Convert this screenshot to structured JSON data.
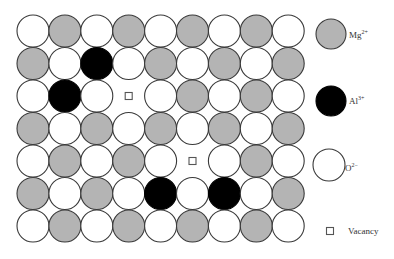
{
  "diagram": {
    "title": "",
    "grid": {
      "columns": 9,
      "rows": 7,
      "origin_x": 33,
      "origin_y": 31,
      "spacing_x": 31.9,
      "spacing_y": 32.5,
      "radius": 16,
      "cells": [
        [
          "O",
          "Mg",
          "O",
          "Mg",
          "O",
          "Mg",
          "O",
          "Mg",
          "O"
        ],
        [
          "Mg",
          "O",
          "Al",
          "O",
          "Mg",
          "O",
          "Mg",
          "O",
          "Mg"
        ],
        [
          "O",
          "Al",
          "O",
          "V",
          "O",
          "Mg",
          "O",
          "Mg",
          "O"
        ],
        [
          "Mg",
          "O",
          "Mg",
          "O",
          "Mg",
          "O",
          "Mg",
          "O",
          "Mg"
        ],
        [
          "O",
          "Mg",
          "O",
          "Mg",
          "O",
          "V",
          "O",
          "Mg",
          "O"
        ],
        [
          "Mg",
          "O",
          "Mg",
          "O",
          "Al",
          "O",
          "Al",
          "O",
          "Mg"
        ],
        [
          "O",
          "Mg",
          "O",
          "Mg",
          "O",
          "Mg",
          "O",
          "Mg",
          "O"
        ]
      ]
    },
    "species": {
      "Mg": {
        "symbol": "Mg",
        "charge": "2+",
        "fill": "#b4b4b4",
        "stroke": "#3a3a3a"
      },
      "Al": {
        "symbol": "Al",
        "charge": "3+",
        "fill": "#000000",
        "stroke": "#000000"
      },
      "O": {
        "symbol": "O",
        "charge": "2−",
        "fill": "#ffffff",
        "stroke": "#3a3a3a"
      },
      "V": {
        "symbol": "Vacancy",
        "charge": "",
        "fill": "#ffffff",
        "stroke": "#555555"
      }
    },
    "legend": {
      "items": [
        {
          "key": "Mg",
          "shape": "circle",
          "cx": 331,
          "cy": 34,
          "r": 15,
          "label_symbol": "Mg",
          "label_charge": "2+",
          "label_x": 349,
          "label_y": 30
        },
        {
          "key": "Al",
          "shape": "circle",
          "cx": 331,
          "cy": 101,
          "r": 15,
          "label_symbol": "Al",
          "label_charge": "3+",
          "label_x": 349,
          "label_y": 96
        },
        {
          "key": "O",
          "shape": "circle",
          "cx": 329,
          "cy": 165,
          "r": 16,
          "label_symbol": "O",
          "label_charge": "2−",
          "label_x": 345,
          "label_y": 163
        },
        {
          "key": "V",
          "shape": "square",
          "cx": 330,
          "cy": 231,
          "size": 7,
          "label_symbol": "Vacancy",
          "label_charge": "",
          "label_x": 348,
          "label_y": 226
        }
      ]
    }
  }
}
